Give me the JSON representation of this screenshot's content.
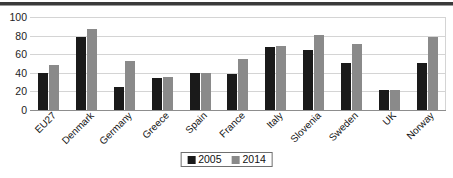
{
  "chart_data": {
    "type": "bar",
    "title": "",
    "subtitle": "",
    "xlabel": "",
    "ylabel": "",
    "ylim": [
      0,
      100
    ],
    "yticks": [
      0,
      20,
      40,
      60,
      80,
      100
    ],
    "grid": true,
    "legend_position": "bottom-center",
    "orientation": "vertical",
    "grouping": "clustered",
    "categories": [
      "EU27",
      "Denmark",
      "Germany",
      "Greece",
      "Spain",
      "France",
      "Italy",
      "Slovenia",
      "Sweden",
      "UK",
      "Norway"
    ],
    "series": [
      {
        "name": "2005",
        "color": "#1a1a1a",
        "values": [
          40,
          78,
          25,
          34,
          40,
          39,
          68,
          64,
          51,
          21,
          51
        ]
      },
      {
        "name": "2014",
        "color": "#8a8a8a",
        "values": [
          48,
          87,
          53,
          36,
          40,
          55,
          69,
          81,
          71,
          22,
          78
        ]
      }
    ]
  },
  "axis": {
    "y_tick_labels": [
      "100",
      "80",
      "60",
      "40",
      "20",
      "0"
    ]
  },
  "legend": {
    "entries": [
      {
        "label": "2005",
        "color": "#1a1a1a"
      },
      {
        "label": "2014",
        "color": "#8a8a8a"
      }
    ]
  },
  "colors": {
    "series_2005": "#1a1a1a",
    "series_2014": "#8a8a8a",
    "gridline": "#d4d4d4",
    "baseline": "#8d8d8d",
    "top_rule": "#3a3a3a",
    "text": "#161616",
    "background": "#ffffff"
  }
}
